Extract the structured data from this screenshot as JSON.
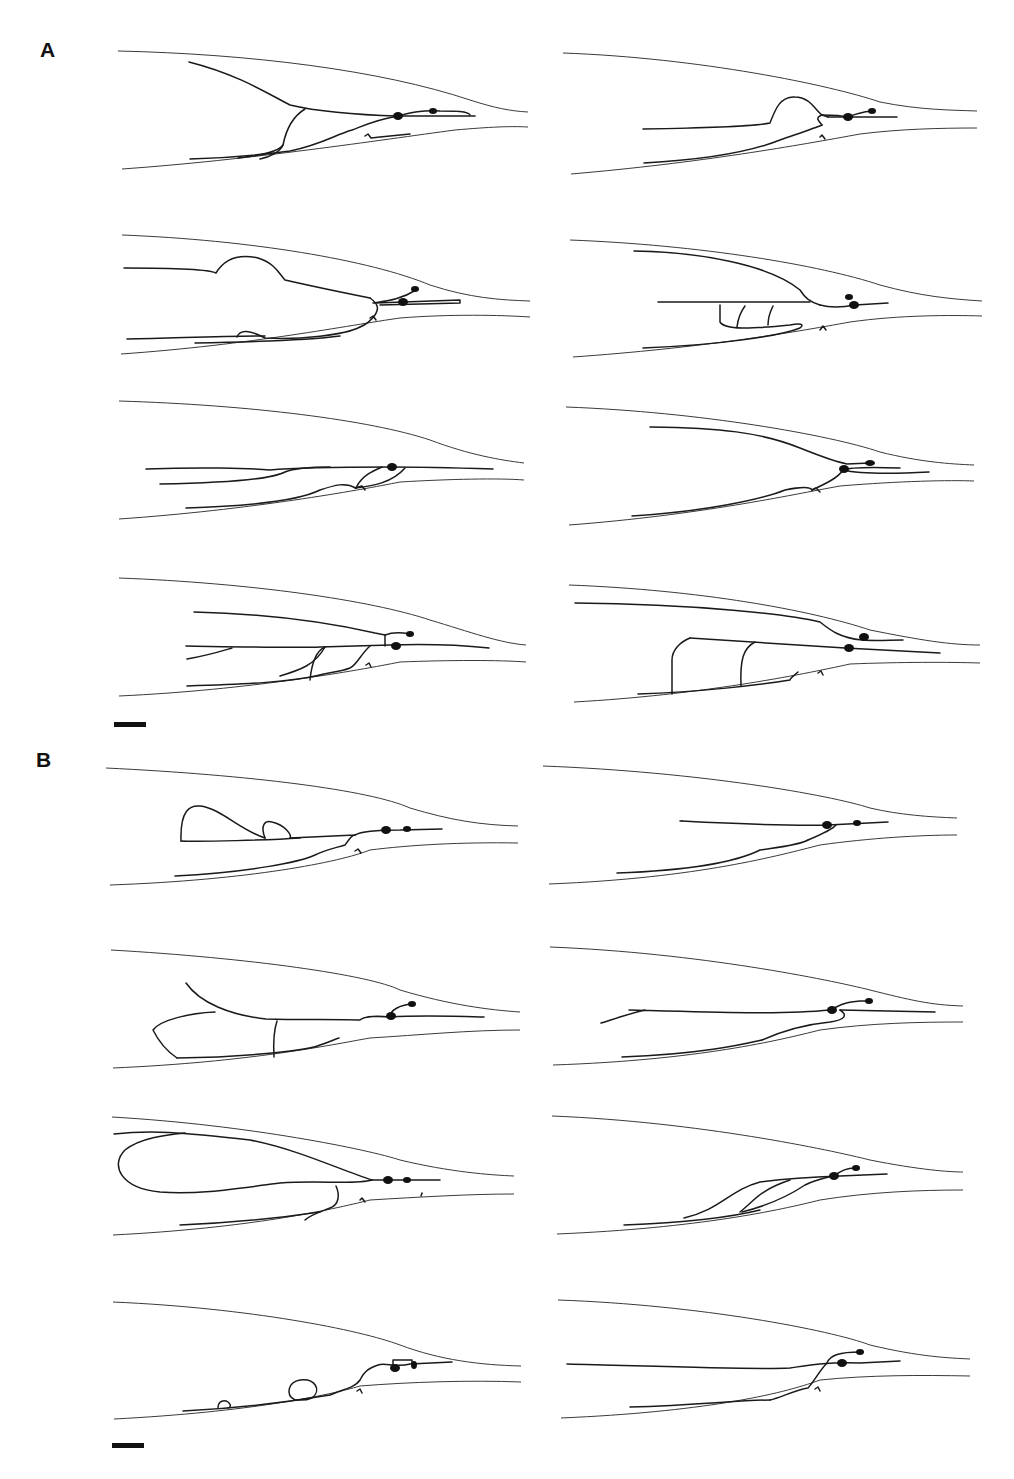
{
  "figure": {
    "panels": [
      {
        "label": "A",
        "x": 40,
        "y": 62
      },
      {
        "label": "B",
        "x": 36,
        "y": 772
      }
    ],
    "colors": {
      "line": "#1a1a1a",
      "outline": "#3a3a3a",
      "background": "#ffffff"
    },
    "scale_bars": [
      {
        "x": 114,
        "y": 722,
        "w": 32,
        "h": 5
      },
      {
        "x": 112,
        "y": 1443,
        "w": 32,
        "h": 5
      }
    ],
    "tracings": [
      {
        "id": "A1",
        "outline": [
          "M118,51 C250,54 380,70 470,100 C495,108 510,111 528,112",
          "M122,169 C250,160 380,140 455,130 C490,127 510,126 528,127"
        ],
        "neurites": [
          "M189,62 C240,75 270,95 290,105 C320,112 360,115 398,116",
          "M398,116 C410,113 420,110 440,111 C455,111 468,111 470,115",
          "M398,116 L475,116",
          "M305,109 C290,118 285,135 283,145 C280,150 265,155 238,158",
          "M190,159 C230,158 260,155 290,151 C320,145 335,135 352,130 C365,125 375,120 398,116",
          "M283,145 C280,152 270,157 260,159",
          "M365,136 L368,134 L371,138 L380,137 L410,134"
        ],
        "somas": [
          {
            "cx": 398,
            "cy": 116,
            "rx": 5,
            "ry": 4
          },
          {
            "cx": 433,
            "cy": 111,
            "rx": 4,
            "ry": 3
          }
        ]
      },
      {
        "id": "A2",
        "outline": [
          "M563,53 C700,58 830,85 880,102 C920,110 950,110 977,111",
          "M571,174 C700,163 800,145 860,134 C900,129 940,128 977,128"
        ],
        "neurites": [
          "M643,129 C700,128 750,127 770,123 C775,110 780,96 795,97 C810,97 815,110 822,115 L828,117",
          "M828,117 L897,117",
          "M822,115 C830,115 840,115 848,117 C855,114 862,112 872,111",
          "M644,163 C700,160 750,152 780,140 C800,133 815,128 822,125",
          "M822,125 C818,120 815,118 822,115",
          "M820,137 L822,135 L825,139"
        ],
        "somas": [
          {
            "cx": 848,
            "cy": 117,
            "rx": 5,
            "ry": 4
          },
          {
            "cx": 872,
            "cy": 111,
            "rx": 4,
            "ry": 3
          }
        ]
      },
      {
        "id": "A3",
        "outline": [
          "M122,235 C250,240 370,260 430,285 C470,298 500,300 530,301",
          "M121,354 C250,345 350,325 400,318 C450,314 500,315 530,317"
        ],
        "neurites": [
          "M124,268 C180,268 210,270 216,273 C225,258 240,254 258,258 C275,263 280,275 285,280 C320,288 355,295 370,298",
          "M370,298 C380,305 378,310 375,315 C370,322 365,325 360,327",
          "M360,327 C345,335 300,340 265,338 C250,330 240,329 237,337",
          "M127,339 C180,338 220,336 265,336",
          "M195,343 C250,342 310,340 340,336",
          "M373,303 C385,301 400,300 416,290",
          "M375,303 L460,300 L460,303 L380,305",
          "M370,318 L373,316 L376,320"
        ],
        "somas": [
          {
            "cx": 415,
            "cy": 289,
            "rx": 4,
            "ry": 3
          },
          {
            "cx": 403,
            "cy": 302,
            "rx": 5,
            "ry": 4
          }
        ]
      },
      {
        "id": "A4",
        "outline": [
          "M570,240 C700,245 820,265 880,285 C920,296 950,299 982,301",
          "M573,357 C700,348 790,333 850,322 C900,315 950,315 982,316"
        ],
        "neurites": [
          "M634,251 C700,252 770,265 800,290 C805,298 810,302 820,305",
          "M658,302 L810,302",
          "M820,305 C830,308 840,308 855,305 L888,303",
          "M720,305 L720,322 C725,330 750,329 790,325 C800,323 805,324 800,328 C780,336 720,345 643,348",
          "M745,306 C742,310 738,318 737,327",
          "M773,306 C770,312 768,318 768,325",
          "M820,330 L823,326 L826,330"
        ],
        "somas": [
          {
            "cx": 854,
            "cy": 305,
            "rx": 5,
            "ry": 4
          },
          {
            "cx": 849,
            "cy": 297,
            "rx": 4,
            "ry": 3
          }
        ]
      },
      {
        "id": "A5",
        "outline": [
          "M119,401 C250,405 370,420 430,440 C470,455 500,460 524,463",
          "M119,519 C250,510 360,490 400,482 C450,479 500,478 524,480"
        ],
        "neurites": [
          "M146,469 C200,467 250,468 270,470 C290,468 330,467 392,467 C420,467 460,468 493,469",
          "M160,484 C220,483 270,480 285,472 C295,468 310,467 330,467",
          "M382,467 C375,470 362,475 356,488",
          "M356,488 C372,486 392,483 405,468",
          "M186,508 C250,506 300,500 320,490 C335,485 345,482 356,488",
          "M355,488 L362,486 L365,490"
        ],
        "somas": [
          {
            "cx": 392,
            "cy": 467,
            "rx": 5,
            "ry": 4
          }
        ]
      },
      {
        "id": "A6",
        "outline": [
          "M566,407 C700,412 830,435 880,452 C920,462 950,464 974,465",
          "M569,525 C700,515 790,495 840,486 C900,481 950,480 974,481"
        ],
        "neurites": [
          "M650,427 C720,428 760,432 800,448 C820,456 830,460 843,463",
          "M843,463 L847,464 L870,463",
          "M843,470 C850,467 870,467 900,468",
          "M843,470 C860,474 890,474 929,472",
          "M843,470 C838,478 825,484 812,490",
          "M632,516 C700,512 760,500 785,490 C800,487 810,486 812,490",
          "M812,490 L816,488 L820,492"
        ],
        "somas": [
          {
            "cx": 844,
            "cy": 469,
            "rx": 5,
            "ry": 4
          },
          {
            "cx": 870,
            "cy": 463,
            "rx": 5,
            "ry": 3
          }
        ]
      },
      {
        "id": "A7",
        "outline": [
          "M119,578 C250,583 370,600 430,620 C470,632 500,643 526,645",
          "M119,696 C250,690 360,670 400,662 C450,660 500,660 526,662"
        ],
        "neurites": [
          "M194,612 C280,614 340,625 375,633 L385,635",
          "M385,635 L385,646",
          "M385,635 C390,633 400,632 410,634",
          "M186,646 C250,647 300,648 320,647 L390,645 C420,644 460,645 489,648",
          "M187,659 C210,655 225,650 232,648",
          "M325,647 C318,650 312,660 310,680",
          "M280,676 C300,670 315,665 325,647",
          "M370,646 C360,655 357,665 350,668 C340,672 330,672 320,675",
          "M187,686 C250,684 290,682 320,675",
          "M366,665 L369,663 L371,667"
        ],
        "somas": [
          {
            "cx": 396,
            "cy": 646,
            "rx": 5,
            "ry": 4
          },
          {
            "cx": 410,
            "cy": 634,
            "rx": 4,
            "ry": 3
          }
        ]
      },
      {
        "id": "A8",
        "outline": [
          "M569,585 C700,590 810,610 870,630 C920,640 950,645 980,645",
          "M574,702 C700,695 800,675 850,664 C900,662 950,662 980,663"
        ],
        "neurites": [
          "M575,603 C700,604 790,615 820,622 C830,630 840,638 862,640 C875,641 890,640 903,640",
          "M690,638 L845,648 L940,653",
          "M690,638 C680,642 672,650 672,660 L672,694",
          "M755,642 C743,648 740,660 741,686",
          "M638,694 C700,692 760,685 790,680 C790,678 795,675 798,672",
          "M818,673 L821,671 L823,675"
        ],
        "somas": [
          {
            "cx": 864,
            "cy": 637,
            "rx": 5,
            "ry": 4
          },
          {
            "cx": 849,
            "cy": 648,
            "rx": 5,
            "ry": 4
          }
        ]
      },
      {
        "id": "B1",
        "outline": [
          "M106,768 C250,775 370,790 410,808 C450,820 480,825 518,826",
          "M110,885 C250,880 340,862 370,850 C410,845 460,842 518,843"
        ],
        "neurites": [
          "M181,841 C200,842 270,840 300,838",
          "M181,841 C180,810 190,805 200,806 C220,808 240,830 265,838",
          "M265,838 C260,825 265,820 272,822 C285,825 292,835 290,838",
          "M290,838 L355,835 C360,832 370,830 400,830 L442,829",
          "M175,876 C250,872 300,862 315,855 C325,850 335,848 345,845 C350,838 352,835 355,835",
          "M355,851 L358,849 L361,853"
        ],
        "somas": [
          {
            "cx": 386,
            "cy": 830,
            "rx": 5,
            "ry": 4
          },
          {
            "cx": 407,
            "cy": 829,
            "rx": 4,
            "ry": 3
          }
        ]
      },
      {
        "id": "B2",
        "outline": [
          "M543,766 C700,772 830,795 870,808 C900,815 930,817 957,818",
          "M549,884 C700,878 780,855 820,845 C870,838 920,835 957,835"
        ],
        "neurites": [
          "M682,821 C720,823 780,826 828,825 L888,822",
          "M682,821 L680,821",
          "M836,825 C832,830 820,835 808,840",
          "M617,873 C700,870 740,860 760,850 C780,847 800,845 808,840"
        ],
        "somas": [
          {
            "cx": 827,
            "cy": 825,
            "rx": 5,
            "ry": 4
          },
          {
            "cx": 857,
            "cy": 823,
            "rx": 4,
            "ry": 3
          }
        ]
      },
      {
        "id": "B3",
        "outline": [
          "M111,950 C250,958 370,975 400,990 C450,1005 490,1010 520,1012",
          "M113,1068 C250,1062 330,1045 370,1038 C420,1035 470,1030 520,1030"
        ],
        "neurites": [
          "M186,983 C200,1003 230,1015 266,1019 C300,1020 340,1019 360,1020 C365,1016 380,1016 390,1017 C420,1015 450,1016 484,1017",
          "M390,1017 C390,1010 400,1005 412,1004",
          "M215,1012 C190,1013 160,1020 153,1030 C158,1040 165,1050 177,1058",
          "M277,1021 C274,1030 273,1040 274,1057",
          "M177,1058 C250,1057 310,1050 320,1045 C330,1042 335,1039 339,1038"
        ],
        "somas": [
          {
            "cx": 391,
            "cy": 1016,
            "rx": 5,
            "ry": 4
          },
          {
            "cx": 412,
            "cy": 1004,
            "rx": 4,
            "ry": 3
          }
        ]
      },
      {
        "id": "B4",
        "outline": [
          "M550,947 C700,953 830,980 870,990 C910,1000 930,1005 963,1006",
          "M553,1065 C700,1060 780,1040 820,1030 C870,1023 920,1022 963,1022"
        ],
        "neurites": [
          "M629,1010 C700,1012 780,1015 830,1010",
          "M601,1023 C620,1017 635,1012 645,1010",
          "M830,1010 C840,1005 845,1002 860,1001 L870,1001",
          "M840,1010 L935,1012",
          "M840,1010 C848,1015 845,1020 830,1022 C800,1025 780,1032 762,1040",
          "M622,1057 C700,1054 740,1045 762,1040"
        ],
        "somas": [
          {
            "cx": 832,
            "cy": 1010,
            "rx": 5,
            "ry": 4
          },
          {
            "cx": 869,
            "cy": 1001,
            "rx": 4,
            "ry": 3
          }
        ]
      },
      {
        "id": "B5",
        "outline": [
          "M112,1117 C250,1125 370,1150 400,1160 C450,1172 490,1175 514,1176",
          "M113,1235 C250,1228 330,1210 370,1200 C420,1197 470,1194 514,1194"
        ],
        "neurites": [
          "M114,1134 C150,1130 180,1132 250,1140 C300,1150 340,1170 372,1180",
          "M372,1180 C355,1185 320,1180 280,1183 C240,1188 200,1195 160,1192 C120,1188 110,1165 125,1150 C140,1138 165,1135 185,1133",
          "M372,1180 L440,1180",
          "M336,1186 C340,1195 339,1205 330,1208 C320,1212 310,1215 305,1220",
          "M180,1225 C250,1222 300,1215 320,1212",
          "M360,1200 L362,1198 L365,1202",
          "M421,1196 L422,1193"
        ],
        "somas": [
          {
            "cx": 388,
            "cy": 1180,
            "rx": 5,
            "ry": 4
          },
          {
            "cx": 407,
            "cy": 1180,
            "rx": 4,
            "ry": 3
          }
        ]
      },
      {
        "id": "B6",
        "outline": [
          "M552,1116 C700,1122 830,1150 870,1160 C920,1170 950,1172 963,1172",
          "M557,1234 C700,1228 780,1210 820,1200 C870,1192 920,1190 963,1190"
        ],
        "neurites": [
          "M684,1218 C720,1210 730,1190 760,1182 C790,1178 810,1177 840,1176 L887,1174",
          "M740,1212 C755,1200 760,1190 790,1180",
          "M742,1212 C770,1205 790,1195 805,1185 C815,1180 825,1178 833,1176",
          "M624,1225 C700,1222 740,1215 760,1210",
          "M833,1176 C840,1172 845,1168 855,1168"
        ],
        "somas": [
          {
            "cx": 834,
            "cy": 1176,
            "rx": 5,
            "ry": 4
          },
          {
            "cx": 856,
            "cy": 1168,
            "rx": 4,
            "ry": 3
          }
        ]
      },
      {
        "id": "B7",
        "outline": [
          "M113,1302 C250,1308 360,1330 400,1345 C440,1360 480,1365 521,1366",
          "M114,1419 C250,1412 330,1395 360,1386 C410,1382 470,1380 521,1382"
        ],
        "neurites": [
          "M183,1411 C250,1408 300,1400 330,1395 C340,1390 355,1388 360,1380 C365,1370 370,1368 378,1365 C385,1362 395,1368 410,1364 L452,1362",
          "M393,1366 L393,1360 L412,1360 L412,1365",
          "M218,1408 C218,1400 225,1400 228,1402 C232,1405 230,1408 228,1408",
          "M295,1400 C285,1395 288,1382 300,1380 C315,1378 322,1390 312,1398 C305,1401 300,1400 295,1400",
          "M357,1391 L360,1389 L362,1393"
        ],
        "somas": [
          {
            "cx": 395,
            "cy": 1368,
            "rx": 5,
            "ry": 4
          },
          {
            "cx": 414,
            "cy": 1365,
            "rx": 3,
            "ry": 4
          }
        ]
      },
      {
        "id": "B8",
        "outline": [
          "M558,1300 C700,1305 830,1330 870,1345 C920,1357 950,1358 970,1359",
          "M561,1418 C700,1412 780,1395 820,1380 C870,1375 920,1375 970,1376"
        ],
        "neurites": [
          "M567,1364 C650,1366 750,1370 790,1368 C810,1365 825,1362 860,1363 L900,1361",
          "M827,1363 C820,1370 815,1380 808,1388 C795,1390 780,1398 770,1400",
          "M630,1407 C700,1405 740,1400 770,1400",
          "M827,1363 C830,1355 840,1352 860,1352",
          "M815,1389 L818,1387 L820,1391"
        ],
        "somas": [
          {
            "cx": 842,
            "cy": 1363,
            "rx": 5,
            "ry": 4
          },
          {
            "cx": 860,
            "cy": 1352,
            "rx": 4,
            "ry": 3
          }
        ]
      }
    ]
  }
}
